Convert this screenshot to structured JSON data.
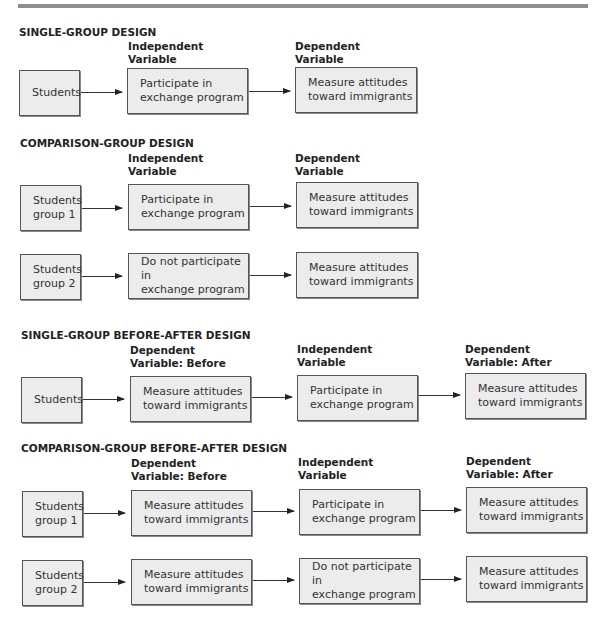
{
  "sections": [
    {
      "title": "SINGLE-GROUP DESIGN",
      "labels": [
        "Independent\nVariable",
        "Dependent\nVariable"
      ],
      "rows": [
        {
          "boxes": [
            "Students",
            "Participate in\nexchange program",
            "Measure attitudes\ntoward immigrants"
          ]
        }
      ]
    },
    {
      "title": "COMPARISON-GROUP DESIGN",
      "labels": [
        "Independent\nVariable",
        "Dependent\nVariable"
      ],
      "rows": [
        {
          "boxes": [
            "Students\ngroup 1",
            "Participate in\nexchange program",
            "Measure attitudes\ntoward immigrants"
          ]
        },
        {
          "boxes": [
            "Students\ngroup 2",
            "Do not participate in\nexchange program",
            "Measure attitudes\ntoward immigrants"
          ]
        }
      ]
    },
    {
      "title": "SINGLE-GROUP BEFORE-AFTER DESIGN",
      "labels": [
        "Dependent\nVariable:  Before",
        "Independent\nVariable",
        "Dependent\nVariable:  After"
      ],
      "rows": [
        {
          "boxes": [
            "Students",
            "Measure attitudes\ntoward immigrants",
            "Participate in\nexchange program",
            "Measure attitudes\ntoward immigrants"
          ]
        }
      ]
    },
    {
      "title": "COMPARISON-GROUP BEFORE-AFTER DESIGN",
      "labels": [
        "Dependent\nVariable:  Before",
        "Independent\nVariable",
        "Dependent\nVariable:  After"
      ],
      "rows": [
        {
          "boxes": [
            "Students\ngroup 1",
            "Measure attitudes\ntoward immigrants",
            "Participate in\nexchange program",
            "Measure attitudes\ntoward immigrants"
          ]
        },
        {
          "boxes": [
            "Students\ngroup 2",
            "Measure attitudes\ntoward immigrants",
            "Do not participate in\nexchange program",
            "Measure attitudes\ntoward immigrants"
          ]
        }
      ]
    }
  ]
}
